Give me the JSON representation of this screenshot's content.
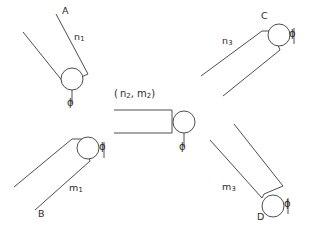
{
  "figure": {
    "background_color": "#ffffff",
    "stroke_color": "#3a3a3a",
    "text_color": "#2b2b2b",
    "width": 318,
    "height": 239
  },
  "assemblies": [
    {
      "id": "top-left",
      "endpoint_label": "A",
      "parameter_label": "n",
      "parameter_subscript": "1",
      "angle_label": "ϕ",
      "bob": {
        "cx": 72,
        "cy": 79,
        "r": 11
      },
      "rod_angle_deg": -55
    },
    {
      "id": "bottom-left",
      "endpoint_label": "B",
      "parameter_label": "m",
      "parameter_subscript": "1",
      "angle_label": "ϕ",
      "bob": {
        "cx": 88,
        "cy": 148,
        "r": 11
      },
      "rod_angle_deg": 35
    },
    {
      "id": "top-right",
      "endpoint_label": "C",
      "parameter_label": "n",
      "parameter_subscript": "3",
      "angle_label": "ϕ",
      "bob": {
        "cx": 279,
        "cy": 35,
        "r": 11
      },
      "rod_angle_deg": 205
    },
    {
      "id": "bottom-right",
      "endpoint_label": "D",
      "parameter_label": "m",
      "parameter_subscript": "3",
      "angle_label": "ϕ",
      "bob": {
        "cx": 273,
        "cy": 206,
        "r": 11
      },
      "rod_angle_deg": 145
    },
    {
      "id": "center",
      "endpoint_label": "",
      "parameter_label_open": "( n",
      "parameter_subscript_1": "2",
      "parameter_label_mid": ", m",
      "parameter_subscript_2": "2",
      "parameter_label_close": ")",
      "angle_label": "ϕ",
      "bob": {
        "cx": 184,
        "cy": 122,
        "r": 11
      },
      "rod_angle_deg": 0
    }
  ],
  "labels": {
    "a": "A",
    "b": "B",
    "c": "C",
    "d": "D",
    "n1_base": "n",
    "n1_sub": "1",
    "m1_base": "m",
    "m1_sub": "1",
    "n3_base": "n",
    "n3_sub": "3",
    "m3_base": "m",
    "m3_sub": "3",
    "center_open": "( n",
    "center_sub1": "2",
    "center_mid": ", m",
    "center_sub2": "2",
    "center_close": ")",
    "phi_top_left": "ϕ",
    "phi_bottom_left": "ϕ",
    "phi_top_right": "ϕ",
    "phi_bottom_right": "ϕ",
    "phi_center": "ϕ"
  }
}
